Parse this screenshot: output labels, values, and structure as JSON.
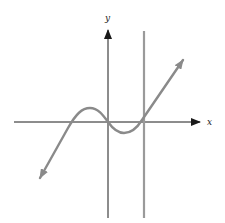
{
  "figure": {
    "x_axis_label": "x",
    "y_axis_label": "y",
    "colors": {
      "axis": "#1a1a1a",
      "curve": "#8a8a8a",
      "vertical_line": "#9a9a9a",
      "background": "#ffffff"
    },
    "elements": [
      {
        "type": "axis",
        "name": "x-axis",
        "direction": "horizontal",
        "arrow": "right"
      },
      {
        "type": "axis",
        "name": "y-axis",
        "direction": "vertical",
        "arrow": "up"
      },
      {
        "type": "line",
        "name": "vertical-line",
        "description": "vertical line to the right of the y-axis, crossing curve at its rising branch"
      },
      {
        "type": "curve",
        "name": "cubic-curve",
        "description": "cubic-shaped curve with local max left of y-axis, local min right of y-axis, arrows on both ends"
      }
    ]
  }
}
